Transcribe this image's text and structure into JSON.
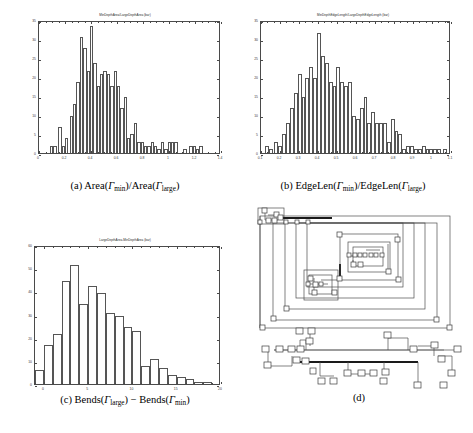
{
  "figure": {
    "panels": [
      {
        "id": "a",
        "caption_prefix": "(a)",
        "caption_text": "Area(Γmin)/Area(Γlarge)",
        "plot_title": "MinDepthArea/LargeDepthArea (bar)"
      },
      {
        "id": "b",
        "caption_prefix": "(b)",
        "caption_text": "EdgeLen(Γmin)/EdgeLen(Γlarge)",
        "plot_title": "MinDepthEdgeLength/LargeDepthEdgeLength (bar)"
      },
      {
        "id": "c",
        "caption_prefix": "(c)",
        "caption_text": "Bends(Γlarge) − Bends(Γmin)",
        "plot_title": "LargeDepthArea-MinDepthArea (bar)"
      },
      {
        "id": "d",
        "caption_prefix": "(d)",
        "caption_text": "",
        "plot_title": ""
      }
    ]
  },
  "chart_data": [
    {
      "type": "bar",
      "panel": "a",
      "title": "MinDepthArea/LargeDepthArea (bar)",
      "xlabel": "",
      "ylabel": "",
      "xlim": [
        0,
        1.4
      ],
      "ylim": [
        0,
        35
      ],
      "xticks": [
        "0",
        "0.2",
        "0.4",
        "0.6",
        "0.8",
        "1",
        "1.2",
        "1.4"
      ],
      "xtick_values": [
        0,
        0.2,
        0.4,
        0.6,
        0.8,
        1,
        1.2,
        1.4
      ],
      "yticks": [
        "0",
        "5",
        "10",
        "15",
        "20",
        "25",
        "30",
        "35"
      ],
      "ytick_values": [
        0,
        5,
        10,
        15,
        20,
        25,
        30,
        35
      ],
      "grid": false,
      "legend": null,
      "bin_width": 0.02,
      "bin_start": 0.0,
      "values": [
        0,
        0,
        0,
        0,
        0,
        0,
        0,
        0,
        2,
        2,
        0,
        7,
        2,
        4,
        0,
        10,
        13,
        19,
        31,
        28,
        22,
        34,
        24,
        18,
        21,
        22,
        21,
        18,
        22,
        18,
        12,
        15,
        4,
        5,
        8,
        3,
        3,
        2,
        2,
        3,
        2,
        1,
        3,
        1,
        3,
        3,
        3,
        0,
        0,
        0,
        0,
        1,
        0,
        0,
        2,
        2,
        1,
        2,
        0,
        0,
        0,
        0,
        0,
        0,
        0,
        0,
        0,
        0,
        0,
        0
      ]
    },
    {
      "type": "bar",
      "panel": "b",
      "title": "MinDepthEdgeLength/LargeDepthEdgeLength (bar)",
      "xlabel": "",
      "ylabel": "",
      "xlim": [
        0.1,
        1.1
      ],
      "ylim": [
        0,
        35
      ],
      "xticks": [
        "0.1",
        "0.2",
        "0.3",
        "0.4",
        "0.5",
        "0.6",
        "0.7",
        "0.8",
        "0.9",
        "1",
        "1.1"
      ],
      "xtick_values": [
        0.1,
        0.2,
        0.3,
        0.4,
        0.5,
        0.6,
        0.7,
        0.8,
        0.9,
        1.0,
        1.1
      ],
      "yticks": [
        "0",
        "5",
        "10",
        "15",
        "20",
        "25",
        "30",
        "35"
      ],
      "ytick_values": [
        0,
        5,
        10,
        15,
        20,
        25,
        30,
        35
      ],
      "grid": false,
      "legend": null,
      "bin_width": 0.02,
      "bin_start": 0.1,
      "values": [
        0,
        0,
        2,
        1,
        0,
        3,
        2,
        5,
        8,
        12,
        16,
        21,
        15,
        20,
        23,
        20,
        32,
        26,
        24,
        19,
        18,
        23,
        19,
        18,
        19,
        10,
        9,
        12,
        15,
        8,
        11,
        8,
        8,
        8,
        3,
        9,
        6,
        5,
        1,
        2,
        2,
        1,
        1,
        2,
        1,
        1,
        1,
        1,
        0,
        1,
        0
      ]
    },
    {
      "type": "bar",
      "panel": "c",
      "title": "LargeDepthArea-MinDepthArea (bar)",
      "xlabel": "",
      "ylabel": "",
      "xlim": [
        -1,
        20
      ],
      "ylim": [
        0,
        60
      ],
      "xticks": [
        "0",
        "5",
        "10",
        "15",
        "20"
      ],
      "xtick_values": [
        0,
        5,
        10,
        15,
        20
      ],
      "yticks": [
        "0",
        "10",
        "20",
        "30",
        "40",
        "50",
        "60"
      ],
      "ytick_values": [
        0,
        10,
        20,
        30,
        40,
        50,
        60
      ],
      "grid": false,
      "legend": null,
      "bin_width": 1,
      "bin_start": -1,
      "values": [
        6,
        17,
        22,
        45,
        52,
        35,
        43,
        40,
        31,
        30,
        25,
        23,
        8,
        11,
        7,
        4,
        3,
        2,
        1,
        1,
        0
      ]
    }
  ],
  "diagram_d": {
    "type": "orthogonal-graph-drawing",
    "views": [
      "nested-spiral-layout",
      "horizontal-chain-layout"
    ],
    "node_shape": "square"
  }
}
